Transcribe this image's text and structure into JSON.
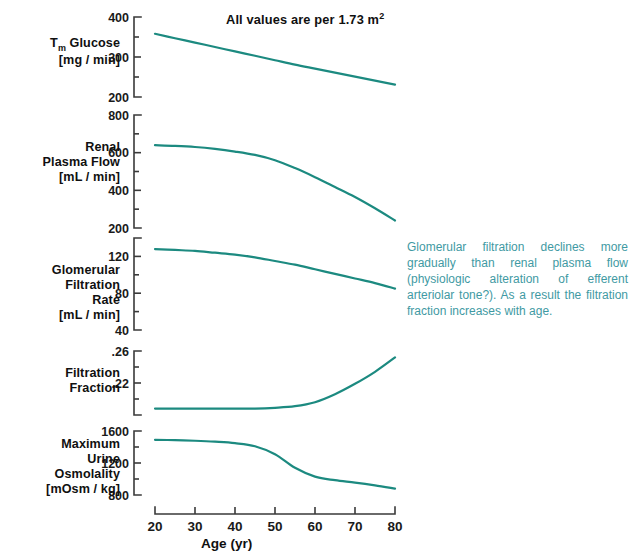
{
  "title": "All values are per 1.73 m",
  "title_sup": "2",
  "xaxis": {
    "label": "Age (yr)",
    "ticks": [
      "20",
      "30",
      "40",
      "50",
      "60",
      "70",
      "80"
    ],
    "min": 20,
    "max": 80
  },
  "annotation": {
    "text": "Glomerular filtration declines more gradually than renal plasma flow (physiologic alteration of efferent arteriolar tone?). As a result the filtration fraction increases with age.",
    "color": "#3f9aa3"
  },
  "colors": {
    "curve": "#1c8a80",
    "axis": "#3a3a3a",
    "text": "#101010"
  },
  "panels": [
    {
      "id": "tm-glucose",
      "label_html": "T<sub>m</sub> Glucose<br>[mg / min]",
      "label_text": "Tm Glucose [mg/min]",
      "yticks": [
        "400",
        "300",
        "200"
      ],
      "ytick_values": [
        400,
        300,
        200
      ],
      "minor_ticks": [
        350,
        250
      ],
      "ymin": 200,
      "ymax": 400
    },
    {
      "id": "renal-plasma-flow",
      "label_html": "Renal<br>Plasma Flow<br>[mL / min]",
      "label_text": "Renal Plasma Flow [mL/min]",
      "yticks": [
        "800",
        "600",
        "400",
        "200"
      ],
      "ytick_values": [
        800,
        600,
        400,
        200
      ],
      "minor_ticks": [
        700,
        500,
        300
      ],
      "ymin": 200,
      "ymax": 800
    },
    {
      "id": "gfr",
      "label_html": "Glomerular<br>Filtration<br>Rate<br>[mL / min]",
      "label_text": "Glomerular Filtration Rate [mL/min]",
      "yticks": [
        "120",
        "80",
        "40"
      ],
      "ytick_values": [
        120,
        80,
        40
      ],
      "minor_ticks": [
        140,
        100,
        60
      ],
      "ymin": 40,
      "ymax": 140
    },
    {
      "id": "filtration-fraction",
      "label_html": "Filtration<br>Fraction",
      "label_text": "Filtration Fraction",
      "yticks": [
        ".26",
        ".22"
      ],
      "ytick_values": [
        0.26,
        0.22
      ],
      "minor_ticks": [
        0.24,
        0.2,
        0.18
      ],
      "ymin": 0.18,
      "ymax": 0.26
    },
    {
      "id": "max-urine-osmolality",
      "label_html": "Maximum<br>Urine<br>Osmolality<br>[mOsm / kg]",
      "label_text": "Maximum Urine Osmolality [mOsm/kg]",
      "yticks": [
        "1600",
        "1200",
        "800"
      ],
      "ytick_values": [
        1600,
        1200,
        800
      ],
      "minor_ticks": [
        1400,
        1000
      ],
      "ymin": 800,
      "ymax": 1600
    }
  ],
  "chart_data": {
    "type": "line",
    "title": "All values are per 1.73 m2",
    "xlabel": "Age (yr)",
    "x": [
      20,
      25,
      30,
      35,
      40,
      45,
      50,
      55,
      60,
      65,
      70,
      75,
      80
    ],
    "xlim": [
      20,
      80
    ],
    "grid": false,
    "legend": "none",
    "series": [
      {
        "name": "Tm Glucose",
        "ylabel": "Tm Glucose [mg / min]",
        "ylim": [
          200,
          400
        ],
        "unit": "mg/min",
        "values": [
          358,
          347,
          336,
          325,
          314,
          303,
          292,
          281,
          271,
          261,
          251,
          241,
          231
        ]
      },
      {
        "name": "Renal Plasma Flow",
        "ylabel": "Renal Plasma Flow [mL / min]",
        "ylim": [
          200,
          800
        ],
        "unit": "mL/min",
        "values": [
          640,
          636,
          630,
          620,
          606,
          588,
          560,
          518,
          470,
          418,
          365,
          305,
          240
        ]
      },
      {
        "name": "Glomerular Filtration Rate",
        "ylabel": "Glomerular Filtration Rate [mL / min]",
        "ylim": [
          40,
          140
        ],
        "unit": "mL/min",
        "values": [
          128,
          127,
          126,
          124,
          122,
          119,
          115,
          111,
          106,
          101,
          96,
          91,
          85
        ]
      },
      {
        "name": "Filtration Fraction",
        "ylabel": "Filtration Fraction",
        "ylim": [
          0.18,
          0.26
        ],
        "unit": "",
        "values": [
          0.188,
          0.188,
          0.188,
          0.188,
          0.188,
          0.188,
          0.189,
          0.191,
          0.196,
          0.206,
          0.219,
          0.234,
          0.252
        ]
      },
      {
        "name": "Maximum Urine Osmolality",
        "ylabel": "Maximum Urine Osmolality [mOsm / kg]",
        "ylim": [
          800,
          1600
        ],
        "unit": "mOsm/kg",
        "values": [
          1490,
          1486,
          1478,
          1466,
          1448,
          1410,
          1310,
          1140,
          1030,
          985,
          955,
          920,
          880
        ]
      }
    ],
    "annotation": "Glomerular filtration declines more gradually than renal plasma flow (physiologic alteration of efferent arteriolar tone?). As a result the filtration fraction increases with age."
  }
}
